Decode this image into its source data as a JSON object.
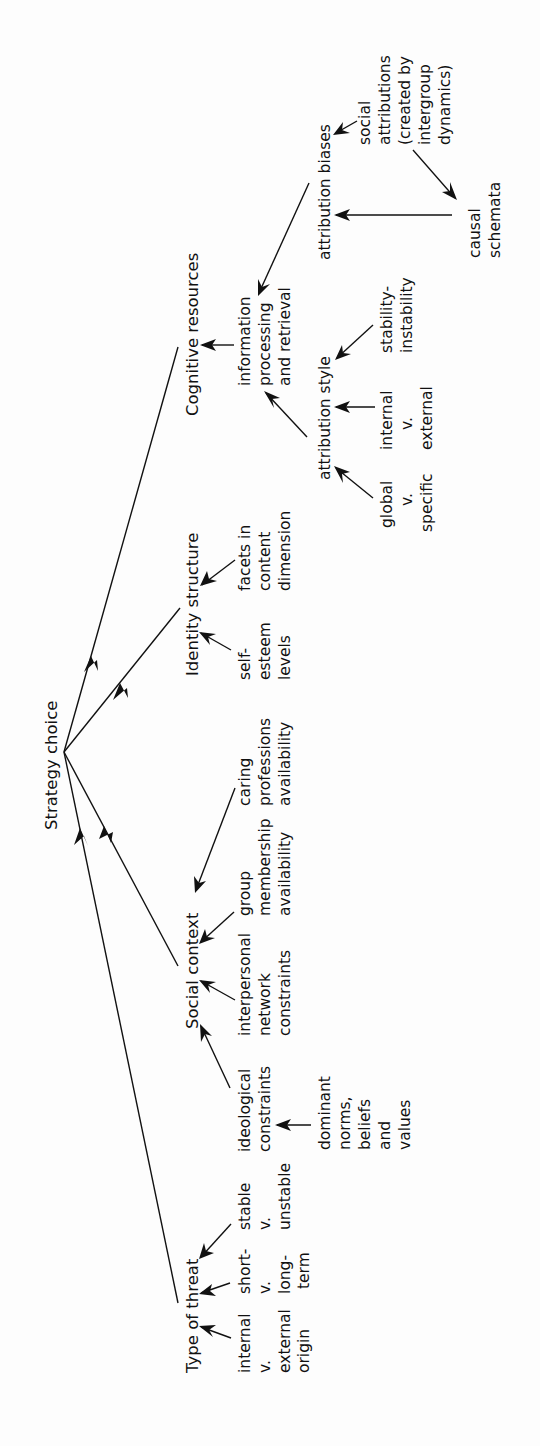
{
  "diagram": {
    "orientation": "rotated-90-ccw",
    "root": {
      "id": "strategy",
      "label": "Strategy choice"
    },
    "nodes": {
      "cognitive": {
        "label": "Cognitive resources"
      },
      "identity": {
        "label": "Identity structure"
      },
      "social": {
        "label": "Social context"
      },
      "threat": {
        "label": "Type of threat"
      },
      "info": {
        "lines": [
          "information",
          "processing",
          "and retrieval"
        ]
      },
      "attr_style": {
        "label": "attribution style"
      },
      "attr_biases": {
        "label": "attribution biases"
      },
      "global": {
        "lines": [
          "global",
          "v.",
          "specific"
        ]
      },
      "int_ext": {
        "lines": [
          "internal",
          "v.",
          "external"
        ]
      },
      "stability": {
        "lines": [
          "stability-",
          "instability"
        ]
      },
      "social_attr": {
        "lines": [
          "social",
          "attributions",
          "(created by",
          "intergroup",
          "dynamics)"
        ]
      },
      "causal": {
        "lines": [
          "causal",
          "schemata"
        ]
      },
      "self_esteem": {
        "lines": [
          "self-",
          "esteem",
          "levels"
        ]
      },
      "facets": {
        "lines": [
          "facets in",
          "content",
          "dimension"
        ]
      },
      "ideological": {
        "lines": [
          "ideological",
          "constraints"
        ]
      },
      "dominant": {
        "lines": [
          "dominant",
          "norms,",
          "beliefs",
          "and",
          "values"
        ]
      },
      "interpersonal": {
        "lines": [
          "interpersonal",
          "network",
          "constraints"
        ]
      },
      "group": {
        "lines": [
          "group",
          "membership",
          "availability"
        ]
      },
      "caring": {
        "lines": [
          "caring",
          "professions",
          "availability"
        ]
      },
      "int_ext_origin": {
        "lines": [
          "internal",
          "v.",
          "external",
          "origin"
        ]
      },
      "short_long": {
        "lines": [
          "short-",
          "v.",
          "long-",
          "term"
        ]
      },
      "stable_unstable": {
        "lines": [
          "stable",
          "v.",
          "unstable"
        ]
      }
    },
    "edges": [
      {
        "from": "cognitive",
        "to": "strategy"
      },
      {
        "from": "identity",
        "to": "strategy"
      },
      {
        "from": "social",
        "to": "strategy"
      },
      {
        "from": "threat",
        "to": "strategy"
      },
      {
        "from": "info",
        "to": "cognitive"
      },
      {
        "from": "attr_style",
        "to": "info"
      },
      {
        "from": "attr_biases",
        "to": "info"
      },
      {
        "from": "global",
        "to": "attr_style"
      },
      {
        "from": "int_ext",
        "to": "attr_style"
      },
      {
        "from": "stability",
        "to": "attr_style"
      },
      {
        "from": "social_attr",
        "to": "attr_biases"
      },
      {
        "from": "social_attr",
        "to": "causal"
      },
      {
        "from": "causal",
        "to": "attr_biases"
      },
      {
        "from": "self_esteem",
        "to": "identity"
      },
      {
        "from": "facets",
        "to": "identity"
      },
      {
        "from": "ideological",
        "to": "social"
      },
      {
        "from": "dominant",
        "to": "ideological"
      },
      {
        "from": "interpersonal",
        "to": "social"
      },
      {
        "from": "group",
        "to": "social"
      },
      {
        "from": "caring",
        "to": "social"
      },
      {
        "from": "int_ext_origin",
        "to": "threat"
      },
      {
        "from": "short_long",
        "to": "threat"
      },
      {
        "from": "stable_unstable",
        "to": "threat"
      }
    ]
  }
}
